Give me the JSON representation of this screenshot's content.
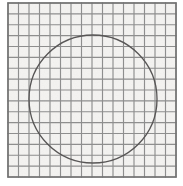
{
  "figure": {
    "canvas": {
      "width": 183,
      "height": 186
    },
    "background_color": "#ffffff",
    "paper_color": "#f4f3f1"
  },
  "chart_data": {
    "type": "scatter",
    "subtitle": "",
    "xlabel": "",
    "ylabel": "",
    "grid": true,
    "legend_position": "none",
    "xlim": [
      0,
      16
    ],
    "ylim": [
      0,
      16
    ],
    "xticks": [
      0,
      1,
      2,
      3,
      4,
      5,
      6,
      7,
      8,
      9,
      10,
      11,
      12,
      13,
      14,
      15,
      16
    ],
    "yticks": [
      0,
      1,
      2,
      3,
      4,
      5,
      6,
      7,
      8,
      9,
      10,
      11,
      12,
      13,
      14,
      15,
      16
    ],
    "xtick_labels": [],
    "ytick_labels": [],
    "annotations": [],
    "series": [
      {
        "name": "circle",
        "shape": "circle",
        "center_x": 8.1,
        "center_y": 8.05,
        "radius": 6.1,
        "stroke_color": "#555353",
        "fill": "none"
      }
    ],
    "grid_spec": {
      "columns": 16,
      "rows": 16,
      "cell_width_px": 10.5,
      "cell_height_px": 10.9,
      "line_color": "#8d8d8d",
      "border_color": "#6e6e6e"
    }
  },
  "geometry": {
    "grid": {
      "left_px": 8,
      "top_px": 3,
      "right_px": 176,
      "bottom_px": 177,
      "columns": 16,
      "rows": 16
    },
    "circle": {
      "center_x_px": 93,
      "center_y_px": 99,
      "radius_px": 64,
      "top_px": 35,
      "bottom_px": 163,
      "left_px": 29,
      "right_px": 157
    }
  }
}
